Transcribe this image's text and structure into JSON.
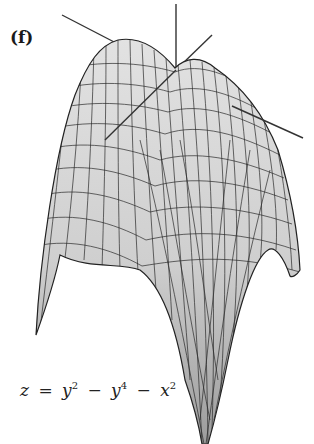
{
  "figure": {
    "panel_label": "(f)",
    "equation": {
      "lhs": "z",
      "eq": "=",
      "t1_base": "y",
      "t1_exp": "2",
      "minus1": "−",
      "t2_base": "y",
      "t2_exp": "4",
      "minus2": "−",
      "t3_base": "x",
      "t3_exp": "2"
    },
    "surface": {
      "type": "3d-wireframe-surface",
      "function": "z = y^2 - y^4 - x^2",
      "fill_color": "#c8c8c8",
      "shadow_color": "#9a9a9a",
      "mesh_color": "#2a2a2a",
      "axes_color": "#333333"
    }
  }
}
